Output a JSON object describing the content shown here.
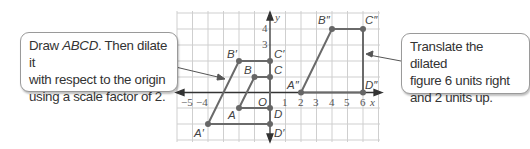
{
  "callouts": {
    "left": {
      "line1_a": "Draw ",
      "line1_b": "ABCD",
      "line1_c": ". Then dilate it",
      "line2": "with respect to the origin",
      "line3": "using a scale factor of 2."
    },
    "right": {
      "line1": "Translate the dilated",
      "line2": "figure 6 units right",
      "line3": "and 2 units up."
    }
  },
  "axes": {
    "x_label": "x",
    "y_label": "y",
    "origin_label": "O",
    "x_ticks": [
      "−5",
      "−4",
      "1",
      "2",
      "3",
      "4",
      "5",
      "6"
    ],
    "y_ticks": [
      "4",
      "3"
    ]
  },
  "figures": {
    "original": {
      "A": "A",
      "B": "B",
      "C": "C",
      "D": "D"
    },
    "dilated": {
      "A": "A′",
      "B": "B′",
      "C": "C′",
      "D": "D′"
    },
    "translated": {
      "A": "A″",
      "B": "B″",
      "C": "C″",
      "D": "D″"
    }
  },
  "colors": {
    "figure_line": "#6a6a6a",
    "grid": "#c8c8c8",
    "axis": "#333333",
    "point": "#666666"
  }
}
